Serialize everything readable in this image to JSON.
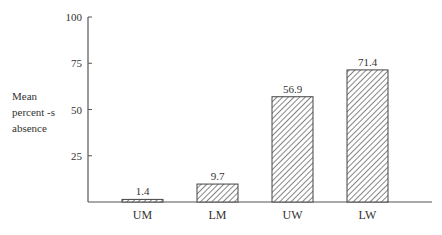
{
  "chart_data": {
    "type": "bar",
    "title": "",
    "xlabel": "",
    "ylabel": "Mean percent -s absence",
    "ylabel_lines": [
      "Mean",
      "percent -s",
      "absence"
    ],
    "categories": [
      "UM",
      "LM",
      "UW",
      "LW"
    ],
    "values": [
      1.4,
      9.7,
      56.9,
      71.4
    ],
    "value_labels": [
      "1.4",
      "9.7",
      "56.9",
      "71.4"
    ],
    "ylim": [
      0,
      100
    ],
    "yticks": [
      25,
      50,
      75,
      100
    ],
    "grid": false,
    "legend": null,
    "bar_fill": "diagonal-hatch",
    "bar_color": "#333333"
  }
}
